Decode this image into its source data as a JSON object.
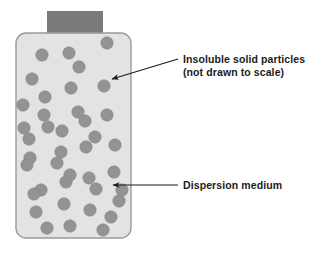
{
  "figure": {
    "type": "diagram",
    "background_color": "#ffffff",
    "container": {
      "name": "dispersion-container",
      "fill_color": "#e3e3e3",
      "stroke_color": "#9a9a9a",
      "x": 16,
      "y": 33,
      "width": 115,
      "height": 205,
      "corner_radius": 10
    },
    "stopper": {
      "name": "container-neck",
      "fill_color": "#7a7a7a",
      "x": 47,
      "y": 11,
      "width": 56,
      "height": 24
    },
    "particles": {
      "fill_color": "#939393",
      "stroke_color": "#868686",
      "radius": 6.2,
      "count": 40,
      "positions": [
        [
          42,
          55
        ],
        [
          69,
          53
        ],
        [
          107,
          43
        ],
        [
          79,
          67
        ],
        [
          32,
          79
        ],
        [
          45,
          97
        ],
        [
          71,
          88
        ],
        [
          104,
          86
        ],
        [
          23,
          105
        ],
        [
          44,
          115
        ],
        [
          78,
          112
        ],
        [
          107,
          115
        ],
        [
          48,
          127
        ],
        [
          29,
          139
        ],
        [
          62,
          131
        ],
        [
          95,
          137
        ],
        [
          30,
          158
        ],
        [
          61,
          152
        ],
        [
          86,
          147
        ],
        [
          115,
          145
        ],
        [
          27,
          165
        ],
        [
          70,
          175
        ],
        [
          89,
          178
        ],
        [
          114,
          172
        ],
        [
          41,
          190
        ],
        [
          66,
          182
        ],
        [
          96,
          189
        ],
        [
          119,
          201
        ],
        [
          36,
          212
        ],
        [
          64,
          204
        ],
        [
          90,
          210
        ],
        [
          111,
          217
        ],
        [
          47,
          228
        ],
        [
          70,
          226
        ],
        [
          103,
          230
        ],
        [
          122,
          190
        ],
        [
          24,
          128
        ],
        [
          57,
          163
        ],
        [
          34,
          194
        ],
        [
          85,
          121
        ]
      ]
    },
    "annotations": [
      {
        "id": "particles-annotation",
        "lines": [
          "Insoluble solid particles",
          "(not drawn to scale)"
        ],
        "text_x": 183,
        "text_y_first_line": 63,
        "line_height": 13,
        "arrow": {
          "name": "particle-arrow",
          "from_x": 178,
          "from_y": 59,
          "to_x": 112,
          "to_y": 79,
          "color": "#1b1b1b"
        }
      },
      {
        "id": "medium-annotation",
        "lines": [
          "Dispersion medium"
        ],
        "text_x": 183,
        "text_y_first_line": 189,
        "line_height": 13,
        "arrow": {
          "name": "medium-arrow",
          "from_x": 178,
          "from_y": 185,
          "to_x": 113,
          "to_y": 185,
          "color": "#1b1b1b"
        }
      }
    ]
  }
}
